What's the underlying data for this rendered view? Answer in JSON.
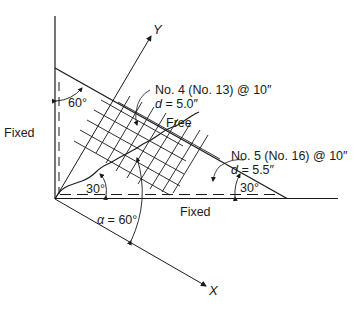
{
  "diagram": {
    "type": "slab-yield-line",
    "labels": {
      "y_axis": "Y",
      "x_axis": "X",
      "fixed_left": "Fixed",
      "fixed_bottom": "Fixed",
      "free_edge": "Free",
      "angle_top": "60°",
      "angle_origin": "30°",
      "angle_right": "30°",
      "alpha_sym": "α",
      "alpha_rest": " = 60°",
      "rebar_top_line1": "No. 4 (No. 13) @ 10″",
      "rebar_top_d_sym": "d",
      "rebar_top_d_rest": " = 5.0″",
      "rebar_bottom_line1": "No. 5 (No. 16) @ 10″",
      "rebar_bottom_d_sym": "d",
      "rebar_bottom_d_rest": " = 5.5″"
    },
    "colors": {
      "line": "#1a1a1a",
      "background": "#ffffff"
    }
  }
}
